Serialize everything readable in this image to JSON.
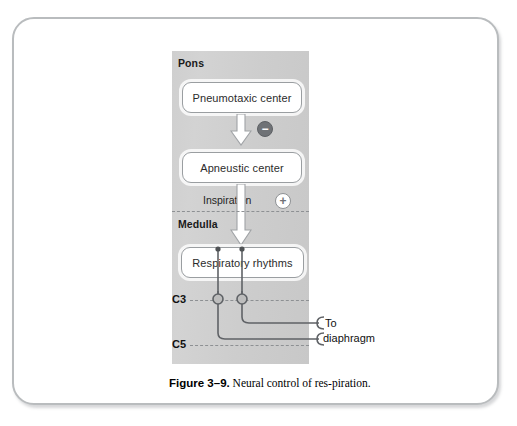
{
  "figure": {
    "caption_title": "Figure 3–9.",
    "caption_text": " Neural control of res-piration."
  },
  "diagram": {
    "regions": [
      {
        "name": "pons",
        "label": "Pons"
      },
      {
        "name": "medulla",
        "label": "Medulla"
      }
    ],
    "nodes": [
      {
        "name": "pneumotaxic-center",
        "label": "Pneumotaxic center"
      },
      {
        "name": "apneustic-center",
        "label": "Apneustic center"
      },
      {
        "name": "respiratory-rhythms",
        "label": "Respiratory rhythms"
      }
    ],
    "signs": [
      {
        "name": "inhibitory-minus",
        "symbol": "−"
      },
      {
        "name": "excitatory-plus",
        "symbol": "+"
      }
    ],
    "pathway_label": "Inspiration",
    "spinal_levels": [
      {
        "name": "c3",
        "label": "C3"
      },
      {
        "name": "c5",
        "label": "C5"
      }
    ],
    "outputs": [
      {
        "name": "to",
        "label": "To"
      },
      {
        "name": "diaphragm",
        "label": "diaphragm"
      }
    ]
  },
  "colors": {
    "panel_gray": "#cfcfcf",
    "frame_border": "#b9bcbe",
    "box_border": "#9a9ea1",
    "minus_badge_fill": "#6f7276",
    "plus_badge_stroke": "#8e9194",
    "dashed_line": "#8d9093",
    "nerve_line": "#5f6266",
    "arrow_fill": "#ffffff",
    "arrow_stroke": "#a0a3a6",
    "text": "#1a1a1a",
    "background": "#ffffff"
  }
}
